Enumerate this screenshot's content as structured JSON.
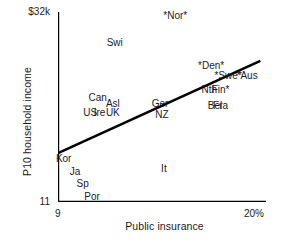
{
  "chart_data": {
    "type": "scatter",
    "title": "",
    "subtitle": "",
    "xlabel": "Public insurance",
    "ylabel": "P10 household income",
    "xlim": [
      9,
      20
    ],
    "ylim": [
      11,
      32
    ],
    "xticks": [
      9,
      20
    ],
    "xticklabels": [
      "9",
      "20%"
    ],
    "yticks": [
      11,
      32
    ],
    "yticklabels": [
      "11",
      "$32k"
    ],
    "grid": false,
    "legend": null,
    "annotation_note": "Country labels are plotted directly as text markers; asterisks flank some country abbreviations.",
    "points": [
      {
        "label": "*Nor*",
        "x": 15.2,
        "y": 31.6
      },
      {
        "label": "Swi",
        "x": 12.0,
        "y": 28.6
      },
      {
        "label": "*Den*",
        "x": 17.1,
        "y": 26.0
      },
      {
        "label": "*Swe*",
        "x": 18.0,
        "y": 24.9
      },
      {
        "label": "*Aus",
        "x": 19.0,
        "y": 24.9
      },
      {
        "label": "Nth",
        "x": 17.0,
        "y": 23.4
      },
      {
        "label": "Fin*",
        "x": 17.6,
        "y": 23.4
      },
      {
        "label": "Can",
        "x": 11.1,
        "y": 22.5
      },
      {
        "label": "Asl",
        "x": 11.9,
        "y": 21.8
      },
      {
        "label": "Ger",
        "x": 14.4,
        "y": 21.8
      },
      {
        "label": "Bel",
        "x": 17.3,
        "y": 21.6
      },
      {
        "label": "Fra",
        "x": 17.6,
        "y": 21.6
      },
      {
        "label": "US",
        "x": 10.7,
        "y": 20.8
      },
      {
        "label": "Ire",
        "x": 11.2,
        "y": 20.8
      },
      {
        "label": "UK",
        "x": 11.9,
        "y": 20.8
      },
      {
        "label": "NZ",
        "x": 14.5,
        "y": 20.6
      },
      {
        "label": "Kor",
        "x": 9.3,
        "y": 15.7
      },
      {
        "label": "It",
        "x": 14.6,
        "y": 14.6
      },
      {
        "label": "Ja",
        "x": 9.9,
        "y": 14.3
      },
      {
        "label": "Sp",
        "x": 10.3,
        "y": 13.0
      },
      {
        "label": "Por",
        "x": 10.8,
        "y": 11.5
      }
    ],
    "fit_line": {
      "type": "linear-fit",
      "x_start": 9.0,
      "y_start": 16.4,
      "x_end": 19.7,
      "y_end": 26.6,
      "color": "#000000",
      "width_px": 2.6
    },
    "axis_color": "#000000",
    "text_color": "#1a1a1a"
  }
}
